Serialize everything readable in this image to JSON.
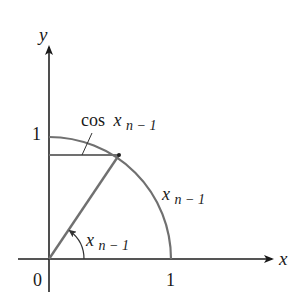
{
  "diagram": {
    "axes": {
      "x_label": "x",
      "y_label": "y",
      "origin_label": "0",
      "x_tick_label": "1",
      "y_tick_label": "1"
    },
    "labels": {
      "cos_label_fn": "cos",
      "cos_label_var": "x",
      "cos_label_sub": "n − 1",
      "arc_label_var": "x",
      "arc_label_sub": "n − 1",
      "angle_label_var": "x",
      "angle_label_sub": "n − 1"
    },
    "colors": {
      "axis": "#1a1a1a",
      "geometry": "#6e6e6e"
    }
  }
}
